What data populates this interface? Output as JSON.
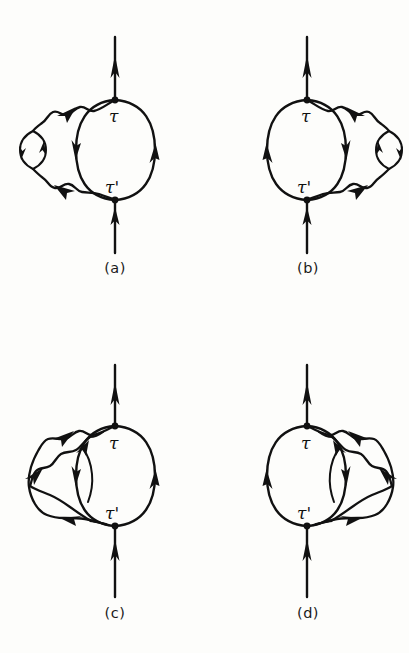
{
  "figure": {
    "type": "feynman-diagram-set",
    "background_color": "#fdfdfb",
    "line_color": "#111111",
    "panel_count": 4
  },
  "vertex_labels": {
    "top": "τ",
    "bottom": "τ'"
  },
  "panels": [
    {
      "id": "a",
      "caption": "(a)",
      "position": "top-left",
      "top_vertex_label": "τ",
      "bottom_vertex_label": "τ'",
      "insertion": "self-energy bubble",
      "insertion_side": "left",
      "external_line_direction": "up"
    },
    {
      "id": "b",
      "caption": "(b)",
      "position": "top-right",
      "top_vertex_label": "τ",
      "bottom_vertex_label": "τ'",
      "insertion": "self-energy bubble",
      "insertion_side": "right",
      "external_line_direction": "up"
    },
    {
      "id": "c",
      "caption": "(c)",
      "position": "bottom-left",
      "top_vertex_label": "τ",
      "bottom_vertex_label": "τ'",
      "insertion": "crossed vertex correction",
      "insertion_side": "left",
      "external_line_direction": "up"
    },
    {
      "id": "d",
      "caption": "(d)",
      "position": "bottom-right",
      "top_vertex_label": "τ",
      "bottom_vertex_label": "τ'",
      "insertion": "crossed vertex correction",
      "insertion_side": "right",
      "external_line_direction": "up"
    }
  ]
}
